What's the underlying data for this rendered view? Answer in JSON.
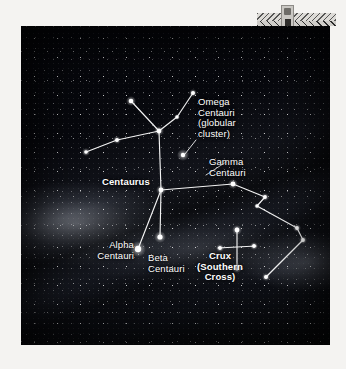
{
  "figure": {
    "kind": "astrophotograph-star-chart",
    "photo_bounds": {
      "x": 21,
      "y": 26,
      "width": 309,
      "height": 319
    },
    "background_color": "#f4f3f1",
    "sky_color": "#07080d",
    "line_color": "#ffffff",
    "label_color": "#ffffff"
  },
  "labels": [
    {
      "id": "omega-centauri",
      "text": "Omega\nCentauri\n(globular\ncluster)",
      "weight": "regular",
      "align": "left",
      "x": 198,
      "y": 97
    },
    {
      "id": "gamma-centauri",
      "text": "Gamma\nCentauri",
      "weight": "regular",
      "align": "left",
      "x": 209,
      "y": 157
    },
    {
      "id": "centaurus",
      "text": "Centaurus",
      "weight": "bold",
      "align": "left",
      "x": 102,
      "y": 177
    },
    {
      "id": "alpha-centauri",
      "text": "Alpha\nCentauri",
      "weight": "regular",
      "align": "right",
      "x": 134,
      "y": 240
    },
    {
      "id": "beta-centauri",
      "text": "Beta\nCentauri",
      "weight": "regular",
      "align": "left",
      "x": 148,
      "y": 253
    },
    {
      "id": "crux",
      "text": "Crux\n(Southern\nCross)",
      "weight": "bold",
      "align": "center",
      "x": 220,
      "y": 251
    }
  ],
  "stars": [
    {
      "id": "cen-upper-left",
      "x": 131,
      "y": 101,
      "r": 2.3,
      "glow": 5
    },
    {
      "id": "cen-upper-right",
      "x": 193,
      "y": 93,
      "r": 2.0,
      "glow": 4
    },
    {
      "id": "cen-epsilon",
      "x": 177,
      "y": 117,
      "r": 1.7,
      "glow": 3
    },
    {
      "id": "cen-hub-upper",
      "x": 159,
      "y": 131,
      "r": 2.4,
      "glow": 5
    },
    {
      "id": "cen-west-mid",
      "x": 117,
      "y": 140,
      "r": 1.9,
      "glow": 4
    },
    {
      "id": "cen-west-end",
      "x": 86,
      "y": 152,
      "r": 1.8,
      "glow": 4
    },
    {
      "id": "omega-cluster",
      "x": 183,
      "y": 155,
      "r": 2.2,
      "glow": 6
    },
    {
      "id": "cen-hub-lower",
      "x": 161,
      "y": 190,
      "r": 2.4,
      "glow": 5
    },
    {
      "id": "gamma-centauri-star",
      "x": 233,
      "y": 184,
      "r": 2.4,
      "glow": 5
    },
    {
      "id": "alpha-centauri-star",
      "x": 138,
      "y": 249,
      "r": 3.2,
      "glow": 8
    },
    {
      "id": "beta-centauri-star",
      "x": 160,
      "y": 237,
      "r": 2.6,
      "glow": 6
    },
    {
      "id": "poly-ne",
      "x": 265,
      "y": 197,
      "r": 1.9,
      "glow": 4
    },
    {
      "id": "poly-elbow",
      "x": 257,
      "y": 206,
      "r": 1.7,
      "glow": 3
    },
    {
      "id": "poly-east",
      "x": 297,
      "y": 228,
      "r": 1.9,
      "glow": 4
    },
    {
      "id": "poly-se",
      "x": 303,
      "y": 240,
      "r": 1.9,
      "glow": 4
    },
    {
      "id": "poly-south",
      "x": 266,
      "y": 277,
      "r": 2.0,
      "glow": 4
    },
    {
      "id": "crux-top",
      "x": 237,
      "y": 230,
      "r": 2.4,
      "glow": 5
    },
    {
      "id": "crux-bottom",
      "x": 237,
      "y": 268,
      "r": 2.2,
      "glow": 5
    },
    {
      "id": "crux-left",
      "x": 220,
      "y": 248,
      "r": 1.9,
      "glow": 4
    },
    {
      "id": "crux-right",
      "x": 254,
      "y": 246,
      "r": 1.9,
      "glow": 4
    }
  ],
  "constellation_lines": {
    "centaurus": [
      [
        [
          131,
          101
        ],
        [
          159,
          131
        ]
      ],
      [
        [
          193,
          93
        ],
        [
          177,
          117
        ]
      ],
      [
        [
          177,
          117
        ],
        [
          159,
          131
        ]
      ],
      [
        [
          159,
          131
        ],
        [
          117,
          140
        ]
      ],
      [
        [
          117,
          140
        ],
        [
          86,
          152
        ]
      ],
      [
        [
          159,
          131
        ],
        [
          161,
          190
        ]
      ],
      [
        [
          161,
          190
        ],
        [
          138,
          249
        ]
      ],
      [
        [
          161,
          190
        ],
        [
          160,
          237
        ]
      ],
      [
        [
          161,
          190
        ],
        [
          233,
          184
        ]
      ],
      [
        [
          233,
          184
        ],
        [
          265,
          197
        ]
      ],
      [
        [
          265,
          197
        ],
        [
          257,
          206
        ]
      ],
      [
        [
          257,
          206
        ],
        [
          297,
          228
        ]
      ],
      [
        [
          297,
          228
        ],
        [
          303,
          240
        ]
      ],
      [
        [
          303,
          240
        ],
        [
          266,
          277
        ]
      ]
    ],
    "crux": [
      [
        [
          237,
          228
        ],
        [
          237,
          270
        ]
      ],
      [
        [
          218,
          248
        ],
        [
          256,
          246
        ]
      ]
    ]
  },
  "leader_lines": [
    {
      "id": "omega-leader",
      "from": [
        196,
        140
      ],
      "to": [
        185,
        154
      ]
    },
    {
      "id": "gamma-leader",
      "from": [
        226,
        162
      ],
      "to": [
        206,
        175
      ]
    }
  ],
  "scan_artifact": {
    "id": "scanner-edge-artifact",
    "description": "zigzag scan band with small chip at top right of page"
  }
}
